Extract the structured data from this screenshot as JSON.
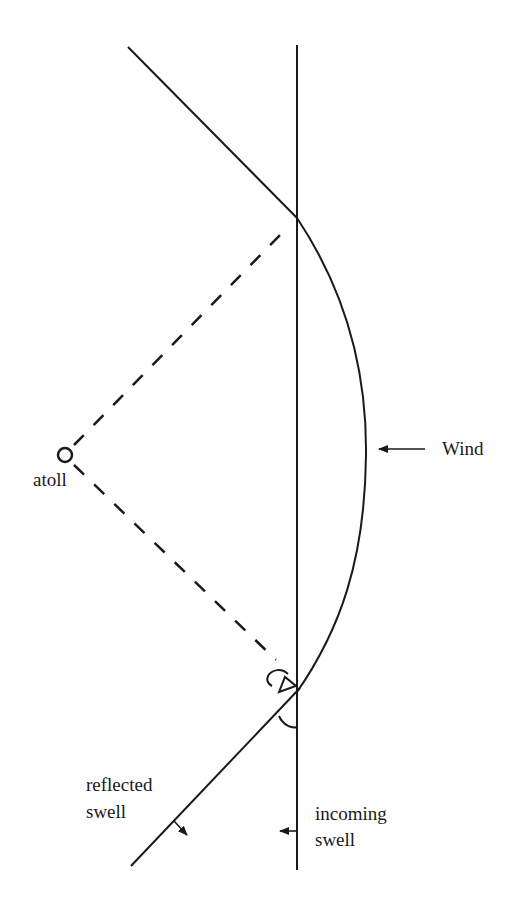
{
  "diagram": {
    "type": "wave-refraction-diagram",
    "labels": {
      "atoll": "atoll",
      "wind": "Wind",
      "reflected_line1": "reflected",
      "reflected_line2": "swell",
      "incoming_line1": "incoming",
      "incoming_line2": "swell"
    },
    "colors": {
      "stroke": "#1a1a1a",
      "background": "#ffffff"
    },
    "elements": [
      "vertical-incoming-swell-line",
      "upper-diagonal-line",
      "curved-swell-arc",
      "lower-reflected-swell-line",
      "atoll-marker",
      "dashed-line-to-top",
      "dashed-line-to-bottom",
      "wind-arrow",
      "incoming-swell-arrow",
      "reflected-swell-arrow",
      "angle-arc-upper",
      "angle-arc-lower"
    ]
  }
}
